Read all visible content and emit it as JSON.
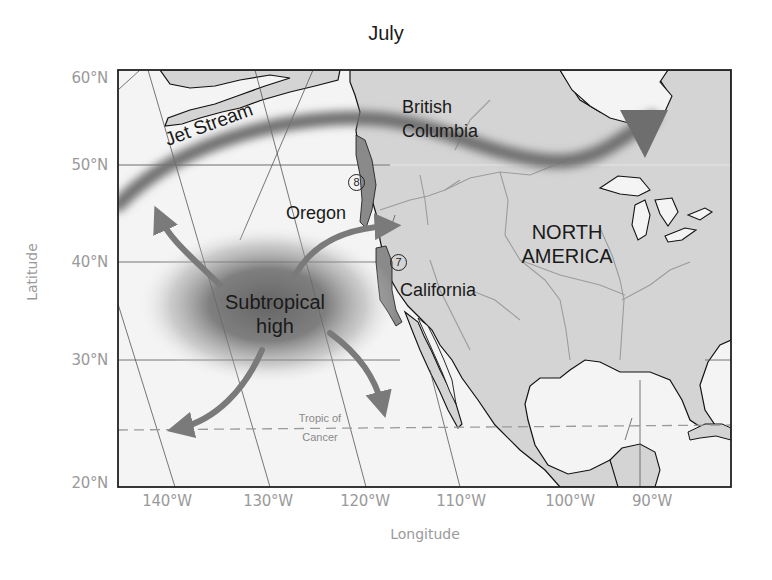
{
  "title": "July",
  "axes": {
    "xlabel": "Longitude",
    "ylabel": "Latitude",
    "lat_ticks": [
      "60°N",
      "50°N",
      "40°N",
      "30°N",
      "20°N"
    ],
    "lon_ticks": [
      "140°W",
      "130°W",
      "120°W",
      "110°W",
      "100°W",
      "90°W"
    ]
  },
  "labels": {
    "jet_stream": "Jet Stream",
    "british_columbia_line1": "British",
    "british_columbia_line2": "Columbia",
    "oregon": "Oregon",
    "california": "California",
    "north_america_line1": "NORTH",
    "north_america_line2": "AMERICA",
    "subtropical_line1": "Subtropical",
    "subtropical_line2": "high",
    "tropic_line1": "Tropic of",
    "tropic_line2": "Cancer",
    "marker_8": "8",
    "marker_7": "7"
  },
  "colors": {
    "land": "#d4d4d4",
    "ocean": "#f4f4f4",
    "coastline": "#111111",
    "rivers": "#9c9c9c",
    "grid": "#555555",
    "jet_stream": "#6e6e6e",
    "arrows": "#7a7a7a",
    "highlight_region": "#8a8a8a",
    "axis_text": "#9a9a9a"
  }
}
